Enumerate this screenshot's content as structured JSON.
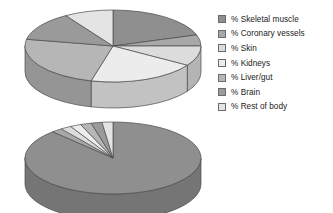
{
  "figure": {
    "background_color": "#ffffff"
  },
  "legend": {
    "position": "right",
    "items": [
      {
        "label": "% Skeletal muscle",
        "color": "#8f8f8f",
        "swatch_name": "legend-swatch-skeletal-muscle"
      },
      {
        "label": "% Coronary vessels",
        "color": "#a8a8a8",
        "swatch_name": "legend-swatch-coronary-vessels"
      },
      {
        "label": "% Skin",
        "color": "#dcdcdc",
        "swatch_name": "legend-swatch-skin"
      },
      {
        "label": "% Kidneys",
        "color": "#ececec",
        "swatch_name": "legend-swatch-kidneys"
      },
      {
        "label": "% Liver/gut",
        "color": "#b6b6b6",
        "swatch_name": "legend-swatch-liver-gut"
      },
      {
        "label": "% Brain",
        "color": "#9a9a9a",
        "swatch_name": "legend-swatch-brain"
      },
      {
        "label": "% Rest of body",
        "color": "#e4e4e4",
        "swatch_name": "legend-swatch-rest-of-body"
      }
    ]
  },
  "chart_data": [
    {
      "id": "pie-rest",
      "type": "pie",
      "title": "",
      "three_d": true,
      "start_angle_deg": -90,
      "direction": "clockwise",
      "categories": [
        "% Skeletal muscle",
        "% Coronary vessels",
        "% Skin",
        "% Kidneys",
        "% Liver/gut",
        "% Brain",
        "% Rest of body"
      ],
      "values": [
        20,
        5,
        9,
        20,
        24,
        13,
        9
      ],
      "colors": [
        "#8f8f8f",
        "#a8a8a8",
        "#dcdcdc",
        "#ececec",
        "#b6b6b6",
        "#9a9a9a",
        "#e4e4e4"
      ],
      "legend": true,
      "labels_shown": false
    },
    {
      "id": "pie-exercise",
      "type": "pie",
      "title": "",
      "three_d": true,
      "start_angle_deg": -90,
      "direction": "clockwise",
      "categories": [
        "% Skeletal muscle",
        "% Coronary vessels",
        "% Skin",
        "% Kidneys",
        "% Liver/gut",
        "% Brain",
        "% Rest of body"
      ],
      "values": [
        88,
        2,
        2,
        2,
        2,
        2,
        2
      ],
      "colors": [
        "#8f8f8f",
        "#a8a8a8",
        "#dcdcdc",
        "#ececec",
        "#b6b6b6",
        "#9a9a9a",
        "#e4e4e4"
      ],
      "legend": true,
      "labels_shown": false
    }
  ],
  "style": {
    "outline_color": "#4a4a4a",
    "side_shade_factor": 0.82
  }
}
